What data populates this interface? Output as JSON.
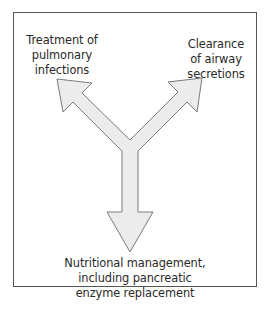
{
  "diagram": {
    "type": "y-shaped-arrow",
    "frame": {
      "border_color": "#555555",
      "background": "#ffffff"
    },
    "arrow": {
      "fill": "#ececec",
      "stroke": "#7a7a7a"
    },
    "labels": {
      "left": {
        "lines": [
          "Treatment of",
          "pulmonary",
          "infections"
        ]
      },
      "right": {
        "lines": [
          "Clearance",
          "of airway",
          "secretions"
        ]
      },
      "bottom": {
        "lines": [
          "Nutritional management,",
          "including pancreatic",
          "enzyme replacement"
        ]
      }
    },
    "directions": [
      {
        "branch": "upper-left",
        "points_to": "Treatment of pulmonary infections"
      },
      {
        "branch": "upper-right",
        "points_to": "Clearance of airway secretions"
      },
      {
        "branch": "down",
        "points_to": "Nutritional management, including pancreatic enzyme replacement"
      }
    ]
  }
}
